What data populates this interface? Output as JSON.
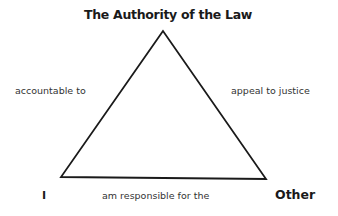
{
  "diagram": {
    "type": "triangle",
    "vertices": {
      "top": "The Authority of the Law",
      "bottom_left": "I",
      "bottom_right": "Other"
    },
    "edges": {
      "left": "accountable to",
      "right": "appeal to justice",
      "bottom": "am responsible for the"
    },
    "colors": {
      "line": "#1a1a1a",
      "text": "#1a1a1a",
      "background": "#ffffff"
    }
  }
}
